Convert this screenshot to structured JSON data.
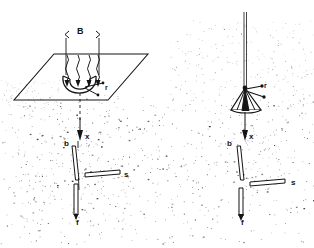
{
  "figure": {
    "background_color": "#ffffff",
    "ink_color": "#151515",
    "width": 314,
    "height": 248,
    "panels": [
      {
        "id": "left-panel",
        "name": "left-diagram",
        "description": "Perspective view with a horizontal parallelogram plane, field arrows B entering from above and curving inward, rod r, shaft x, element b, bar s and stem f below ground",
        "labels": [
          {
            "key": "B",
            "text": "B",
            "role": "dimension-label",
            "x": 77,
            "y": 32
          },
          {
            "key": "r",
            "text": "r",
            "role": "part-label",
            "x": 105,
            "y": 86
          },
          {
            "key": "x",
            "text": "x",
            "role": "axis-label",
            "x": 85,
            "y": 137
          },
          {
            "key": "b",
            "text": "b",
            "role": "part-label",
            "x": 64,
            "y": 143
          },
          {
            "key": "s",
            "text": "s",
            "role": "part-label",
            "x": 124,
            "y": 175
          },
          {
            "key": "f",
            "text": "f",
            "role": "part-label",
            "x": 76,
            "y": 222
          }
        ]
      },
      {
        "id": "right-panel",
        "name": "right-diagram",
        "description": "Elevation view without the plane: vertical line through a bell/cone body r, shaft x, element b, bar s and stem f",
        "labels": [
          {
            "key": "r",
            "text": "r",
            "role": "part-label",
            "x": 264,
            "y": 84
          },
          {
            "key": "x",
            "text": "x",
            "role": "axis-label",
            "x": 246,
            "y": 137
          },
          {
            "key": "b",
            "text": "b",
            "role": "part-label",
            "x": 225,
            "y": 143
          },
          {
            "key": "s",
            "text": "s",
            "role": "part-label",
            "x": 289,
            "y": 183
          },
          {
            "key": "f",
            "text": "f",
            "role": "part-label",
            "x": 240,
            "y": 222
          }
        ]
      }
    ],
    "speckle": {
      "description": "scanned halftone noise representing ground/soil medium",
      "density_dots": 1500,
      "color": "#2a2a2a"
    }
  }
}
